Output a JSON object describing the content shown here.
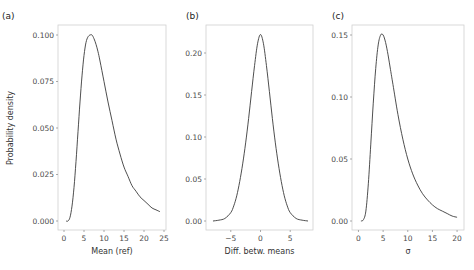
{
  "figure": {
    "ylabel": "Probability density"
  },
  "chart_data": [
    {
      "type": "line",
      "panel": "(a)",
      "title": "",
      "xlabel": "Mean (ref)",
      "ylabel": "Probability density",
      "xlim": [
        -0.5,
        25
      ],
      "ylim": [
        0,
        0.105
      ],
      "xticks": [
        0,
        5,
        10,
        15,
        20,
        25
      ],
      "xtick_labels": [
        "0",
        "5",
        "10",
        "15",
        "20",
        "25"
      ],
      "yticks": [
        0.0,
        0.025,
        0.05,
        0.075,
        0.1
      ],
      "ytick_labels": [
        "0.000",
        "0.025",
        "0.050",
        "0.075",
        "0.100"
      ],
      "grid": false,
      "series": [
        {
          "name": "density",
          "x": [
            0.5,
            1,
            1.5,
            2,
            2.5,
            3,
            3.5,
            4,
            4.5,
            5,
            5.5,
            6,
            6.5,
            7,
            7.5,
            8,
            8.5,
            9,
            10,
            11,
            12,
            13,
            14,
            15,
            16,
            17,
            18,
            19,
            20,
            21,
            22,
            23,
            24
          ],
          "y": [
            0.0,
            0.0,
            0.002,
            0.008,
            0.018,
            0.032,
            0.048,
            0.064,
            0.078,
            0.089,
            0.096,
            0.099,
            0.1,
            0.1,
            0.098,
            0.095,
            0.091,
            0.086,
            0.075,
            0.064,
            0.054,
            0.044,
            0.036,
            0.029,
            0.024,
            0.019,
            0.016,
            0.013,
            0.011,
            0.009,
            0.007,
            0.006,
            0.005
          ]
        }
      ]
    },
    {
      "type": "line",
      "panel": "(b)",
      "title": "",
      "xlabel": "Diff. betw. means",
      "ylabel": "",
      "xlim": [
        -8.5,
        8.5
      ],
      "ylim": [
        0,
        0.235
      ],
      "xticks": [
        -5,
        0,
        5
      ],
      "xtick_labels": [
        "−5",
        "0",
        "5"
      ],
      "yticks": [
        0.0,
        0.05,
        0.1,
        0.15,
        0.2
      ],
      "ytick_labels": [
        "0.00",
        "0.05",
        "0.10",
        "0.15",
        "0.20"
      ],
      "grid": false,
      "series": [
        {
          "name": "density",
          "x": [
            -8,
            -7,
            -6,
            -5,
            -4.5,
            -4,
            -3.5,
            -3,
            -2.5,
            -2,
            -1.5,
            -1,
            -0.5,
            0,
            0.5,
            1,
            1.5,
            2,
            2.5,
            3,
            3.5,
            4,
            4.5,
            5,
            6,
            7,
            8
          ],
          "y": [
            0.0,
            0.001,
            0.003,
            0.01,
            0.018,
            0.03,
            0.047,
            0.068,
            0.093,
            0.122,
            0.154,
            0.185,
            0.211,
            0.222,
            0.211,
            0.185,
            0.154,
            0.122,
            0.093,
            0.068,
            0.047,
            0.03,
            0.018,
            0.01,
            0.003,
            0.001,
            0.0
          ]
        }
      ]
    },
    {
      "type": "line",
      "panel": "(c)",
      "title": "",
      "xlabel": "σ",
      "ylabel": "",
      "xlim": [
        -0.5,
        21
      ],
      "ylim": [
        0,
        0.157
      ],
      "xticks": [
        0,
        5,
        10,
        15,
        20
      ],
      "xtick_labels": [
        "0",
        "5",
        "10",
        "15",
        "20"
      ],
      "yticks": [
        0.0,
        0.05,
        0.1,
        0.15
      ],
      "ytick_labels": [
        "0.00",
        "0.05",
        "0.10",
        "0.15"
      ],
      "grid": false,
      "series": [
        {
          "name": "density",
          "x": [
            0.5,
            1,
            1.5,
            2,
            2.5,
            3,
            3.5,
            4,
            4.5,
            5,
            5.5,
            6,
            6.5,
            7,
            8,
            9,
            10,
            11,
            12,
            13,
            14,
            15,
            16,
            17,
            18,
            19,
            20
          ],
          "y": [
            0.0,
            0.001,
            0.008,
            0.03,
            0.062,
            0.095,
            0.123,
            0.142,
            0.15,
            0.15,
            0.144,
            0.134,
            0.122,
            0.11,
            0.086,
            0.066,
            0.05,
            0.038,
            0.029,
            0.022,
            0.017,
            0.013,
            0.01,
            0.008,
            0.006,
            0.004,
            0.003
          ]
        }
      ]
    }
  ]
}
